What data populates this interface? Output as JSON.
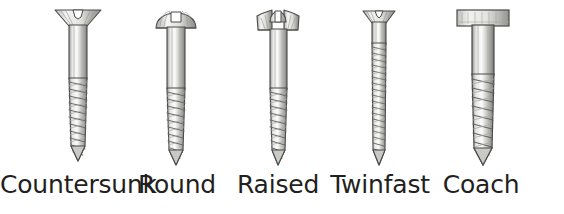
{
  "figure": {
    "kind": "illustration-plate",
    "background_color": "#ffffff",
    "label_color": "#231f20",
    "outline_color": "#4a4a4a",
    "metal_light": "#f2f2f0",
    "metal_mid": "#c9c9c6",
    "metal_dark": "#8d8d8a"
  },
  "screws": [
    {
      "id": "countersunk",
      "label": "Countersunk",
      "head_type": "flat-countersunk",
      "drive": "slotted",
      "center_x": 78,
      "label_center_x": 78,
      "head_width": 46,
      "head_height": 16,
      "shank_width": 17,
      "shank_top": 24,
      "thread_start": 78,
      "tip_y": 160
    },
    {
      "id": "round",
      "label": "Round",
      "head_type": "dome-round",
      "drive": "slotted",
      "center_x": 176,
      "label_center_x": 177,
      "head_width": 40,
      "head_height": 18,
      "shank_width": 17,
      "shank_top": 26,
      "thread_start": 88,
      "tip_y": 164
    },
    {
      "id": "raised",
      "label": "Raised",
      "head_type": "raised-countersunk",
      "drive": "slotted",
      "center_x": 278,
      "label_center_x": 278,
      "head_width": 42,
      "head_height": 20,
      "shank_width": 16,
      "shank_top": 28,
      "thread_start": 88,
      "tip_y": 164
    },
    {
      "id": "twinfast",
      "label": "Twinfast",
      "head_type": "flat-countersunk",
      "drive": "slotted",
      "center_x": 379,
      "label_center_x": 380,
      "head_width": 32,
      "head_height": 12,
      "shank_width": 12,
      "shank_top": 22,
      "thread_start": 44,
      "tip_y": 164
    },
    {
      "id": "coach",
      "label": "Coach",
      "head_type": "square-hex-block",
      "drive": "none",
      "center_x": 481,
      "label_center_x": 481,
      "head_width": 48,
      "head_height": 16,
      "shank_width": 22,
      "shank_top": 26,
      "thread_start": 74,
      "tip_y": 164
    }
  ]
}
